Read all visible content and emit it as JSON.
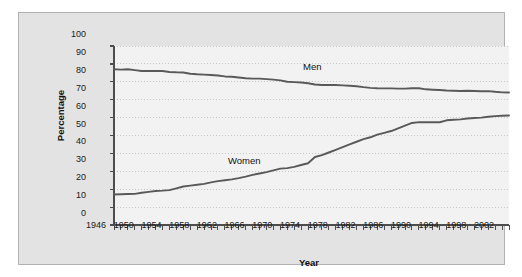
{
  "chart_data": {
    "type": "line",
    "title": "",
    "xlabel": "Year",
    "ylabel": "Percentage",
    "xlim": [
      1946,
      2003
    ],
    "ylim": [
      0,
      100
    ],
    "ytick_step": 10,
    "xtick_step": 1,
    "xlabel_step": 4,
    "grid": true,
    "grid_style": "dotted-horizontal",
    "legend": "inline-labels",
    "yticks": [
      0,
      10,
      20,
      30,
      40,
      50,
      60,
      70,
      80,
      90,
      100
    ],
    "xticks": [
      1946,
      1947,
      1948,
      1949,
      1950,
      1951,
      1952,
      1953,
      1954,
      1955,
      1956,
      1957,
      1958,
      1959,
      1960,
      1961,
      1962,
      1963,
      1964,
      1965,
      1966,
      1967,
      1968,
      1969,
      1970,
      1971,
      1972,
      1973,
      1974,
      1975,
      1976,
      1977,
      1978,
      1979,
      1980,
      1981,
      1982,
      1983,
      1984,
      1985,
      1986,
      1987,
      1988,
      1989,
      1990,
      1991,
      1992,
      1993,
      1994,
      1995,
      1996,
      1997,
      1998,
      1999,
      2000,
      2001,
      2002,
      2003
    ],
    "xticklabels": [
      "1946",
      "1950",
      "1954",
      "1958",
      "1962",
      "1966",
      "1970",
      "1974",
      "1978",
      "1982",
      "1986",
      "1990",
      "1994",
      "1998",
      "2002"
    ],
    "x": [
      1946,
      1947,
      1948,
      1949,
      1950,
      1951,
      1952,
      1953,
      1954,
      1955,
      1956,
      1957,
      1958,
      1959,
      1960,
      1961,
      1962,
      1963,
      1964,
      1965,
      1966,
      1967,
      1968,
      1969,
      1970,
      1971,
      1972,
      1973,
      1974,
      1975,
      1976,
      1977,
      1978,
      1979,
      1980,
      1981,
      1982,
      1983,
      1984,
      1985,
      1986,
      1987,
      1988,
      1989,
      1990,
      1991,
      1992,
      1993,
      1994,
      1995,
      1996,
      1997,
      1998,
      1999,
      2000,
      2001,
      2002,
      2003
    ],
    "series": [
      {
        "name": "Men",
        "color": "#595959",
        "values": [
          87.0,
          86.8,
          87.0,
          86.5,
          86.0,
          86.0,
          86.0,
          86.0,
          85.5,
          85.3,
          85.2,
          84.5,
          84.2,
          84.0,
          83.8,
          83.5,
          83.0,
          82.8,
          82.4,
          82.0,
          81.8,
          81.8,
          81.5,
          81.2,
          80.8,
          80.0,
          79.8,
          79.6,
          79.2,
          78.5,
          78.2,
          78.2,
          78.2,
          78.0,
          77.8,
          77.5,
          77.0,
          76.6,
          76.4,
          76.3,
          76.3,
          76.2,
          76.2,
          76.4,
          76.4,
          75.8,
          75.6,
          75.4,
          75.1,
          75.0,
          74.9,
          75.0,
          74.9,
          74.7,
          74.8,
          74.4,
          74.1,
          74.0
        ]
      },
      {
        "name": "Women",
        "color": "#595959",
        "values": [
          17.0,
          17.2,
          17.3,
          17.4,
          18.0,
          18.5,
          19.0,
          19.2,
          19.5,
          20.5,
          21.5,
          22.0,
          22.5,
          23.0,
          23.8,
          24.5,
          25.0,
          25.5,
          26.2,
          27.0,
          28.0,
          28.8,
          29.5,
          30.5,
          31.5,
          31.8,
          32.5,
          33.5,
          34.5,
          38.0,
          39.0,
          40.5,
          42.0,
          43.5,
          45.0,
          46.5,
          48.0,
          49.0,
          50.5,
          51.5,
          52.5,
          54.0,
          55.5,
          57.0,
          57.5,
          57.4,
          57.4,
          57.4,
          58.5,
          58.8,
          59.0,
          59.5,
          59.8,
          60.0,
          60.5,
          60.8,
          61.0,
          61.2
        ]
      }
    ]
  },
  "axes": {
    "y_title": "Percentage",
    "x_title": "Year"
  },
  "labels": {
    "men": "Men",
    "women": "Women"
  },
  "colors": {
    "panel_background": "#e3e3e3",
    "plot_background": "#f2f2f2",
    "panel_border": "#b2b2b2",
    "axis": "#4d4d4d",
    "grid": "#c8c8c8",
    "line": "#595959",
    "text": "#1a1a1a"
  }
}
